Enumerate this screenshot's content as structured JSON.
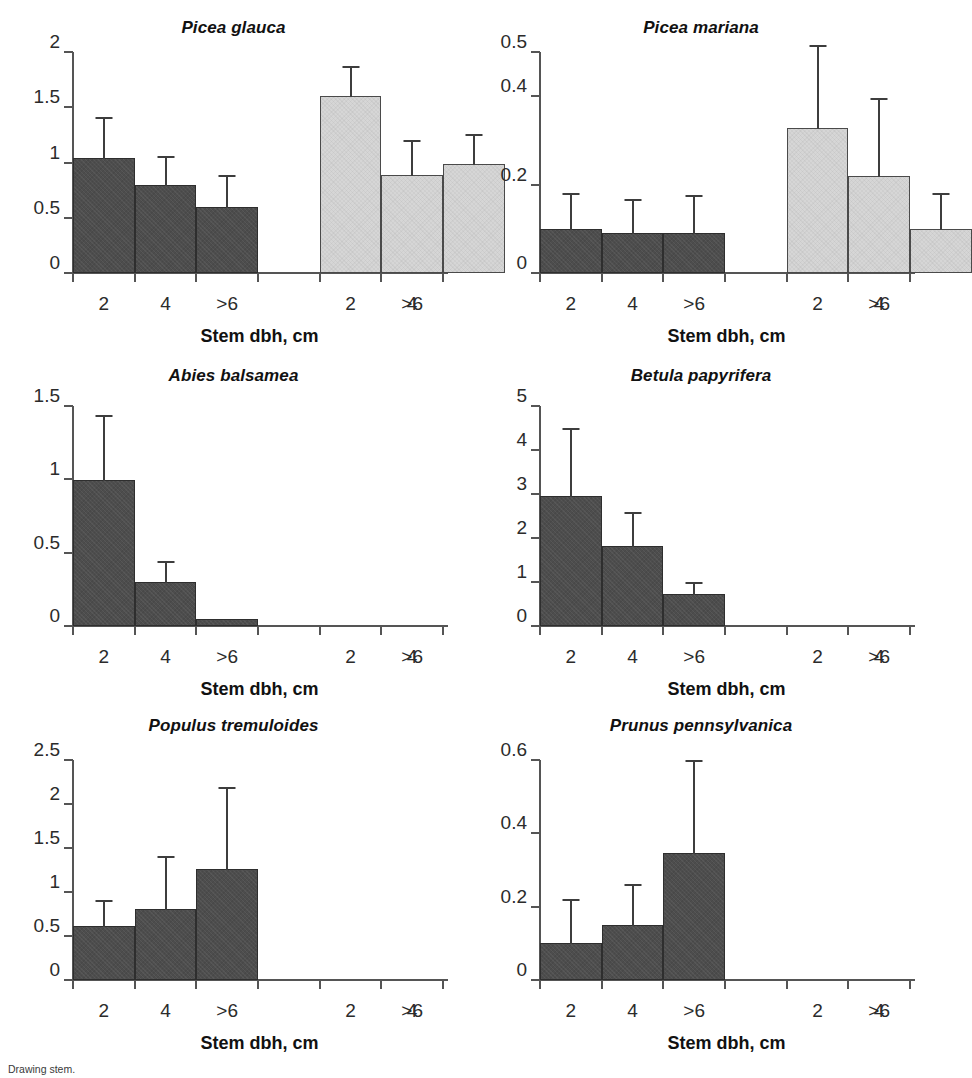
{
  "figure": {
    "xlabel": "Stem dbh, cm",
    "caption": "Drawing stem.",
    "colors": {
      "dark_bar": "#4d4d4d",
      "light_bar": "#d6d6d6",
      "axis": "#555555",
      "text": "#1a1a1a"
    }
  },
  "chart_data": [
    {
      "type": "bar",
      "title": "Picea glauca",
      "xlabel": "Stem dbh, cm",
      "ylabel": "",
      "ylim": [
        0,
        2
      ],
      "yticks": [
        0,
        0.5,
        1,
        1.5,
        2
      ],
      "ytick_labels": [
        "0",
        "0.5",
        "1",
        "1.5",
        "2"
      ],
      "grid": false,
      "legend": "none",
      "slots": 6,
      "categories": [
        "2",
        "4",
        ">6",
        "",
        "2",
        "4",
        ">6"
      ],
      "tick_labels": [
        "2",
        "4",
        ">6",
        "2",
        "4",
        ">6"
      ],
      "bars": [
        {
          "slot": 0,
          "label": "2",
          "group": "dark",
          "value": 1.03,
          "error": 0.38
        },
        {
          "slot": 1,
          "label": "4",
          "group": "dark",
          "value": 0.79,
          "error": 0.27
        },
        {
          "slot": 2,
          "label": ">6",
          "group": "dark",
          "value": 0.59,
          "error": 0.3
        },
        {
          "slot": 3,
          "label": "2",
          "group": "light",
          "value": 1.59,
          "error": 0.28
        },
        {
          "slot": 4,
          "label": "4",
          "group": "light",
          "value": 0.88,
          "error": 0.32
        },
        {
          "slot": 5,
          "label": ">6",
          "group": "light",
          "value": 0.98,
          "error": 0.28
        }
      ]
    },
    {
      "type": "bar",
      "title": "Picea mariana",
      "xlabel": "Stem dbh, cm",
      "ylabel": "",
      "ylim": [
        0,
        0.5
      ],
      "yticks": [
        0,
        0.2,
        0.4,
        0.5
      ],
      "ytick_labels": [
        "0",
        "0.2",
        "0.4",
        "0.5"
      ],
      "grid": false,
      "legend": "none",
      "slots": 6,
      "tick_labels": [
        "2",
        "4",
        ">6",
        "2",
        "4",
        ">6"
      ],
      "bars": [
        {
          "slot": 0,
          "label": "2",
          "group": "dark",
          "value": 0.098,
          "error": 0.082
        },
        {
          "slot": 1,
          "label": "4",
          "group": "dark",
          "value": 0.088,
          "error": 0.08
        },
        {
          "slot": 2,
          "label": ">6",
          "group": "dark",
          "value": 0.088,
          "error": 0.088
        },
        {
          "slot": 3,
          "label": "2",
          "group": "light",
          "value": 0.325,
          "error": 0.19
        },
        {
          "slot": 4,
          "label": "4",
          "group": "light",
          "value": 0.217,
          "error": 0.178
        },
        {
          "slot": 5,
          "label": ">6",
          "group": "light",
          "value": 0.098,
          "error": 0.082
        }
      ]
    },
    {
      "type": "bar",
      "title": "Abies balsamea",
      "xlabel": "Stem dbh, cm",
      "ylabel": "",
      "ylim": [
        0,
        1.5
      ],
      "yticks": [
        0,
        0.5,
        1,
        1.5
      ],
      "ytick_labels": [
        "0",
        "0.5",
        "1",
        "1.5"
      ],
      "grid": false,
      "legend": "none",
      "slots": 6,
      "tick_labels": [
        "2",
        "4",
        ">6",
        "2",
        "4",
        ">6"
      ],
      "bars": [
        {
          "slot": 0,
          "label": "2",
          "group": "dark",
          "value": 0.99,
          "error": 0.45
        },
        {
          "slot": 1,
          "label": "4",
          "group": "dark",
          "value": 0.29,
          "error": 0.15
        },
        {
          "slot": 2,
          "label": ">6",
          "group": "dark",
          "value": 0.04,
          "error": 0.0
        }
      ]
    },
    {
      "type": "bar",
      "title": "Betula papyrifera",
      "xlabel": "Stem dbh, cm",
      "ylabel": "",
      "ylim": [
        0,
        5
      ],
      "yticks": [
        0,
        1,
        2,
        3,
        4,
        5
      ],
      "ytick_labels": [
        "0",
        "1",
        "2",
        "3",
        "4",
        "5"
      ],
      "grid": false,
      "legend": "none",
      "slots": 6,
      "tick_labels": [
        "2",
        "4",
        ">6",
        "2",
        "4",
        ">6"
      ],
      "bars": [
        {
          "slot": 0,
          "label": "2",
          "group": "dark",
          "value": 2.93,
          "error": 1.57
        },
        {
          "slot": 1,
          "label": "4",
          "group": "dark",
          "value": 1.79,
          "error": 0.81
        },
        {
          "slot": 2,
          "label": ">6",
          "group": "dark",
          "value": 0.7,
          "error": 0.31
        }
      ]
    },
    {
      "type": "bar",
      "title": "Populus tremuloides",
      "xlabel": "Stem dbh, cm",
      "ylabel": "",
      "ylim": [
        0,
        2.5
      ],
      "yticks": [
        0,
        0.5,
        1,
        1.5,
        2,
        2.5
      ],
      "ytick_labels": [
        "0",
        "0.5",
        "1",
        "1.5",
        "2",
        "2.5"
      ],
      "grid": false,
      "legend": "none",
      "slots": 6,
      "tick_labels": [
        "2",
        "4",
        ">6",
        "2",
        "4",
        ">6"
      ],
      "bars": [
        {
          "slot": 0,
          "label": "2",
          "group": "dark",
          "value": 0.6,
          "error": 0.31
        },
        {
          "slot": 1,
          "label": "4",
          "group": "dark",
          "value": 0.8,
          "error": 0.61
        },
        {
          "slot": 2,
          "label": ">6",
          "group": "dark",
          "value": 1.25,
          "error": 0.94
        }
      ]
    },
    {
      "type": "bar",
      "title": "Prunus pennsylvanica",
      "xlabel": "Stem dbh, cm",
      "ylabel": "",
      "ylim": [
        0,
        0.6
      ],
      "yticks": [
        0,
        0.2,
        0.4,
        0.6
      ],
      "ytick_labels": [
        "0",
        "0.2",
        "0.4",
        "0.6"
      ],
      "grid": false,
      "legend": "none",
      "slots": 6,
      "tick_labels": [
        "2",
        "4",
        ">6",
        "2",
        "4",
        ">6"
      ],
      "bars": [
        {
          "slot": 0,
          "label": "2",
          "group": "dark",
          "value": 0.097,
          "error": 0.125
        },
        {
          "slot": 1,
          "label": "4",
          "group": "dark",
          "value": 0.146,
          "error": 0.115
        },
        {
          "slot": 2,
          "label": ">6",
          "group": "dark",
          "value": 0.345,
          "error": 0.255
        }
      ]
    }
  ]
}
